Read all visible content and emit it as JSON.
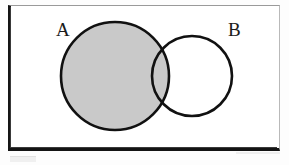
{
  "figure": {
    "kind": "venn-diagram",
    "title": "",
    "frame": {
      "shape": "rectangle",
      "label": "",
      "border_color_dark": "#141414",
      "border_color_light": "#b9b9b9",
      "fill": "#ffffff"
    },
    "sets": [
      {
        "id": "A",
        "label": "A",
        "label_position": "outside-upper-left",
        "shaded": true,
        "fill": "#c9c9c9",
        "stroke": "#111111",
        "center_x": 115,
        "center_y": 76,
        "radius": 54
      },
      {
        "id": "B",
        "label": "B",
        "label_position": "outside-upper-right",
        "shaded": false,
        "fill": "#ffffff",
        "stroke": "#111111",
        "center_x": 192,
        "center_y": 76,
        "radius": 40
      }
    ],
    "regions": {
      "a_only": "shaded",
      "intersection": "shaded",
      "b_only": "unshaded",
      "outside": "unshaded"
    },
    "shade_color": "#c9c9c9",
    "stroke_color": "#111111",
    "background_color": "#ffffff"
  }
}
